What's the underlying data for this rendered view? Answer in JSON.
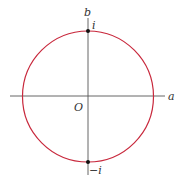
{
  "diagram": {
    "type": "unit-circle-complex-plane",
    "colors": {
      "circle": "#c8283c",
      "axis": "#555555",
      "point": "#111111",
      "label": "#333333"
    },
    "axes": {
      "horizontal_label": "a",
      "vertical_label": "b",
      "origin_label": "O"
    },
    "points": [
      {
        "label": "i",
        "position": "top"
      },
      {
        "label": "−i",
        "position": "bottom"
      }
    ]
  }
}
